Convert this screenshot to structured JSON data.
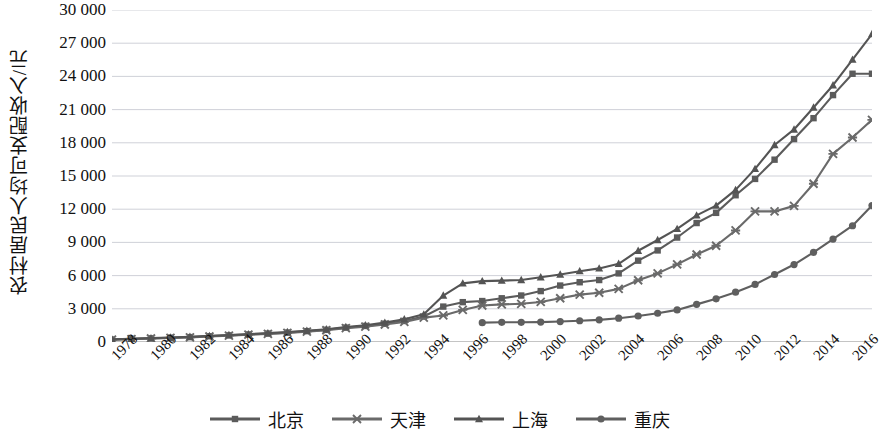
{
  "chart_data": {
    "type": "line",
    "title": "",
    "xlabel": "",
    "ylabel": "农村居民人均可支配收入/元",
    "ylim": [
      0,
      30000
    ],
    "ytick_step": 3000,
    "ytick_labels": [
      "30 000",
      "27 000",
      "24 000",
      "21 000",
      "18 000",
      "15 000",
      "12 000",
      "9 000",
      "6 000",
      "3 000",
      "0"
    ],
    "ytick_values": [
      30000,
      27000,
      24000,
      21000,
      18000,
      15000,
      12000,
      9000,
      6000,
      3000,
      0
    ],
    "grid": true,
    "legend_position": "bottom",
    "xlim": [
      1978,
      2017
    ],
    "xtick_labels": [
      "1978",
      "1980",
      "1982",
      "1984",
      "1986",
      "1988",
      "1990",
      "1992",
      "1994",
      "1996",
      "1998",
      "2000",
      "2002",
      "2004",
      "2006",
      "2008",
      "2010",
      "2012",
      "2014",
      "2016"
    ],
    "x": [
      1978,
      1979,
      1980,
      1981,
      1982,
      1983,
      1984,
      1985,
      1986,
      1987,
      1988,
      1989,
      1990,
      1991,
      1992,
      1993,
      1994,
      1995,
      1996,
      1997,
      1998,
      1999,
      2000,
      2001,
      2002,
      2003,
      2004,
      2005,
      2006,
      2007,
      2008,
      2009,
      2010,
      2011,
      2012,
      2013,
      2014,
      2015,
      2016,
      2017
    ],
    "series": [
      {
        "name": "北京",
        "marker": "square",
        "color": "#5b5b5b",
        "values": [
          225,
          280,
          330,
          390,
          440,
          520,
          600,
          680,
          760,
          850,
          980,
          1100,
          1300,
          1450,
          1650,
          1900,
          2300,
          3200,
          3600,
          3700,
          3950,
          4200,
          4600,
          5100,
          5400,
          5600,
          6200,
          7350,
          8275,
          9440,
          10750,
          11670,
          13262,
          14736,
          16476,
          18337,
          20226,
          22310,
          24240,
          24240
        ]
      },
      {
        "name": "天津",
        "marker": "x",
        "color": "#6a6a6a",
        "values": [
          210,
          260,
          315,
          370,
          420,
          500,
          580,
          660,
          730,
          820,
          940,
          1060,
          1250,
          1390,
          1580,
          1820,
          2200,
          2400,
          2900,
          3300,
          3400,
          3450,
          3620,
          3950,
          4280,
          4450,
          4800,
          5580,
          6200,
          7010,
          7910,
          8700,
          10080,
          11800,
          11800,
          12300,
          14300,
          17000,
          18482,
          20075
        ]
      },
      {
        "name": "上海",
        "marker": "triangle",
        "color": "#545454",
        "values": [
          240,
          300,
          350,
          410,
          470,
          550,
          630,
          710,
          800,
          900,
          1020,
          1150,
          1350,
          1520,
          1750,
          2050,
          2500,
          4200,
          5300,
          5500,
          5550,
          5600,
          5850,
          6100,
          6400,
          6650,
          7066,
          8248,
          9213,
          10222,
          11440,
          12324,
          13746,
          15644,
          17804,
          19208,
          21192,
          23205,
          25520,
          27825
        ]
      },
      {
        "name": "重庆",
        "marker": "circle",
        "color": "#5f5f5f",
        "values": [
          null,
          null,
          null,
          null,
          null,
          null,
          null,
          null,
          null,
          null,
          null,
          null,
          null,
          null,
          null,
          null,
          null,
          null,
          null,
          1750,
          1780,
          1780,
          1800,
          1850,
          1920,
          2000,
          2150,
          2350,
          2600,
          2900,
          3400,
          3900,
          4500,
          5200,
          6100,
          7000,
          8100,
          9300,
          10505,
          12330
        ]
      }
    ]
  },
  "legend": {
    "items": [
      {
        "label": "北京",
        "marker": "square"
      },
      {
        "label": "天津",
        "marker": "x"
      },
      {
        "label": "上海",
        "marker": "triangle"
      },
      {
        "label": "重庆",
        "marker": "circle"
      }
    ]
  }
}
